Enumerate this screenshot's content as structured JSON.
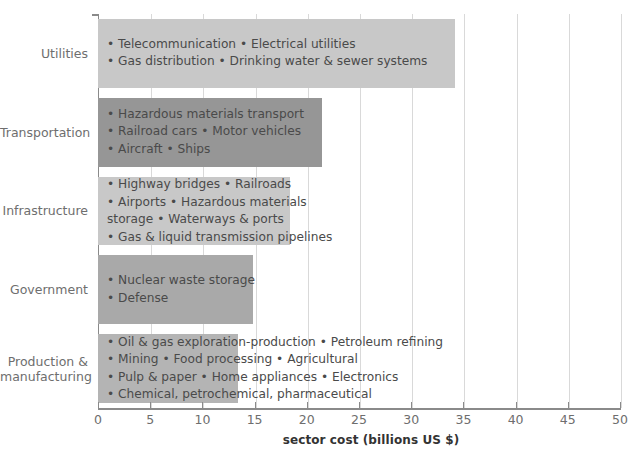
{
  "chart_data": {
    "type": "bar",
    "orientation": "horizontal",
    "title": "",
    "xlabel": "sector cost (billions US $)",
    "ylabel": "",
    "xlim": [
      0,
      50
    ],
    "xticks": [
      "0",
      "5",
      "10",
      "15",
      "20",
      "25",
      "30",
      "35",
      "40",
      "45",
      "50"
    ],
    "grid": true,
    "legend": "none",
    "categories": [
      "Utilities",
      "Transportation",
      "Infrastructure",
      "Government",
      "Production & manufacturing"
    ],
    "values": [
      34.2,
      21.5,
      18.4,
      14.8,
      13.4
    ],
    "colors": [
      "#c8c8c8",
      "#969696",
      "#c8c8c8",
      "#a9a9a9",
      "#b4b4b4"
    ],
    "bars": [
      {
        "category": "Utilities",
        "category_lines": [
          "Utilities"
        ],
        "value": 34.2,
        "color": "#c8c8c8",
        "lines": [
          "• Telecommunication • Electrical utilities",
          "• Gas distribution • Drinking water & sewer systems"
        ]
      },
      {
        "category": "Transportation",
        "category_lines": [
          "Transportation"
        ],
        "value": 21.5,
        "color": "#969696",
        "lines": [
          "• Hazardous materials transport",
          "• Railroad cars • Motor vehicles",
          "• Aircraft • Ships"
        ]
      },
      {
        "category": "Infrastructure",
        "category_lines": [
          "Infrastructure"
        ],
        "value": 18.4,
        "color": "#c8c8c8",
        "lines": [
          "• Highway bridges • Railroads",
          "• Airports • Hazardous materials",
          "   storage • Waterways & ports",
          "• Gas & liquid transmission pipelines"
        ]
      },
      {
        "category": "Government",
        "category_lines": [
          "Government"
        ],
        "value": 14.8,
        "color": "#a9a9a9",
        "lines": [
          "• Nuclear waste storage",
          "• Defense"
        ]
      },
      {
        "category": "Production & manufacturing",
        "category_lines": [
          "Production &",
          "manufacturing"
        ],
        "value": 13.4,
        "color": "#b4b4b4",
        "lines": [
          "• Oil & gas exploration-production • Petroleum refining",
          "• Mining • Food processing • Agricultural",
          "• Pulp & paper • Home appliances • Electronics",
          "• Chemical, petrochemical, pharmaceutical"
        ]
      }
    ]
  },
  "axis": {
    "x_title": "sector cost (billions US $)"
  }
}
